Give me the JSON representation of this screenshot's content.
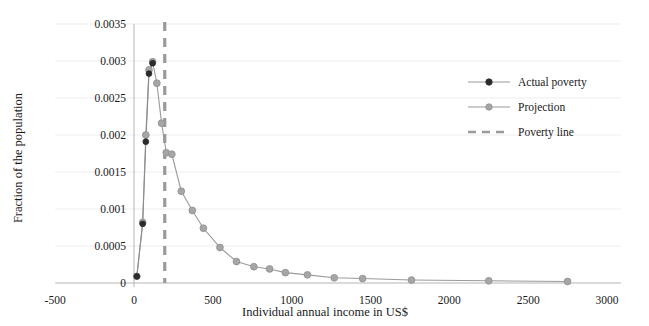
{
  "chart_data": {
    "type": "line",
    "title": "",
    "xlabel": "Individual annual income in US$",
    "ylabel": "Fraction of the population",
    "xlim": [
      -500,
      3000
    ],
    "ylim": [
      0,
      0.0035
    ],
    "xticks": [
      -500,
      0,
      500,
      1000,
      1500,
      2000,
      2500,
      3000
    ],
    "xtick_labels": [
      "-500",
      "0",
      "500",
      "1000",
      "1500",
      "2000",
      "2500",
      "3000"
    ],
    "yticks": [
      0,
      0.0005,
      0.001,
      0.0015,
      0.002,
      0.0025,
      0.003,
      0.0035
    ],
    "ytick_labels": [
      "0",
      "0.0005",
      "0.001",
      "0.0015",
      "0.002",
      "0.0025",
      "0.003",
      "0.0035"
    ],
    "grid": "horizontal",
    "legend_position": "right",
    "series": [
      {
        "name": "Actual poverty",
        "marker_color": "#2b2b2b",
        "line_color": "#8d8d8d",
        "x": [
          18,
          55,
          75,
          95,
          118
        ],
        "y": [
          9e-05,
          0.0008,
          0.00191,
          0.00283,
          0.00297
        ]
      },
      {
        "name": "Projection",
        "marker_color": "#a6a6a6",
        "line_color": "#9a9a9a",
        "x": [
          18,
          55,
          75,
          95,
          118,
          145,
          175,
          205,
          240,
          300,
          370,
          440,
          545,
          650,
          760,
          860,
          960,
          1100,
          1270,
          1450,
          1760,
          2250,
          2750
        ],
        "y": [
          9e-05,
          0.00082,
          0.002,
          0.00288,
          0.00299,
          0.0027,
          0.00216,
          0.00176,
          0.00174,
          0.00124,
          0.00098,
          0.00074,
          0.00048,
          0.00029,
          0.00022,
          0.00019,
          0.00014,
          0.00011,
          7e-05,
          6e-05,
          4e-05,
          3e-05,
          2e-05
        ]
      }
    ],
    "reference_line": {
      "name": "Poverty line",
      "orientation": "vertical",
      "x": 195,
      "color": "#9a9a9a",
      "style": "dashed"
    },
    "legend_entries": [
      {
        "label": "Actual poverty",
        "type": "line-marker",
        "color": "#2b2b2b"
      },
      {
        "label": "Projection",
        "type": "line-marker",
        "color": "#a6a6a6"
      },
      {
        "label": "Poverty line",
        "type": "dashed-line",
        "color": "#9a9a9a"
      }
    ]
  },
  "colors": {
    "actual": "#2b2b2b",
    "projection": "#a6a6a6",
    "poverty_line": "#9a9a9a",
    "grid": "#ededed",
    "axis": "#b5b5b5",
    "text": "#1a1a1a"
  }
}
